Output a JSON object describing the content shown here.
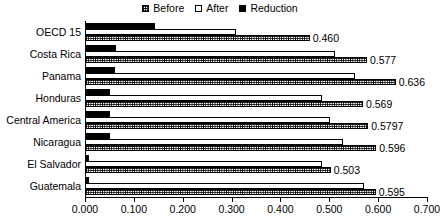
{
  "chart_data": {
    "type": "bar",
    "orientation": "horizontal",
    "title": "",
    "subtitle": "",
    "xlabel": "",
    "ylabel": "",
    "xlim": [
      0.0,
      0.7
    ],
    "xticks": [
      "0.000",
      "0.100",
      "0.200",
      "0.300",
      "0.400",
      "0.500",
      "0.600",
      "0.700"
    ],
    "xtick_values": [
      0.0,
      0.1,
      0.2,
      0.3,
      0.4,
      0.5,
      0.6,
      0.7
    ],
    "grid": false,
    "legend_position": "top-center",
    "categories": [
      "OECD 15",
      "Costa Rica",
      "Panama",
      "Honduras",
      "Central America",
      "Nicaragua",
      "El Salvador",
      "Guatemala"
    ],
    "series": [
      {
        "name": "Before",
        "style": "checkered",
        "values": [
          0.46,
          0.577,
          0.636,
          0.569,
          0.5797,
          0.596,
          0.503,
          0.595
        ],
        "labels": [
          "0.460",
          "0.577",
          "0.636",
          "0.569",
          "0.5797",
          "0.596",
          "0.503",
          "0.595"
        ]
      },
      {
        "name": "After",
        "style": "white",
        "values": [
          0.31,
          0.512,
          0.552,
          0.485,
          0.502,
          0.528,
          0.485,
          0.572
        ],
        "labels": [
          "",
          "",
          "",
          "",
          "",
          "",
          "",
          ""
        ]
      },
      {
        "name": "Reduction",
        "style": "solid-black",
        "values": [
          0.143,
          0.063,
          0.062,
          0.052,
          0.052,
          0.051,
          0.009,
          0.009
        ],
        "labels": [
          "",
          "",
          "",
          "",
          "",
          "",
          "",
          ""
        ]
      }
    ]
  },
  "legend": {
    "items": [
      {
        "label": "Before",
        "swatch": "checkered-square-icon"
      },
      {
        "label": "After",
        "swatch": "empty-square-icon"
      },
      {
        "label": "Reduction",
        "swatch": "filled-square-icon"
      }
    ]
  },
  "colors": {
    "axis": "#000000",
    "bar_outline": "#000000",
    "reduction_fill": "#000000",
    "after_fill": "#ffffff",
    "before_fill": "#ffffff",
    "background": "#ffffff",
    "text": "#000000"
  }
}
